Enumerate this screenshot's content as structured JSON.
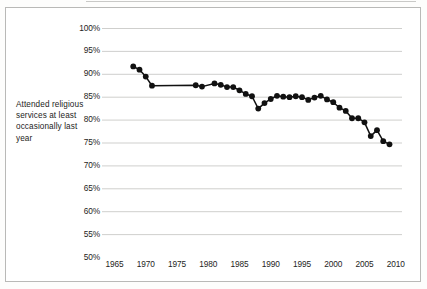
{
  "figure": {
    "axis_caption": "Attended religious services at least occasionally last year"
  },
  "chart_data": {
    "type": "line",
    "title": "",
    "subtitle": "",
    "xlabel": "",
    "ylabel": "Attended religious services at least occasionally last year",
    "xlim": [
      1963,
      2011
    ],
    "ylim": [
      50,
      100
    ],
    "xticks": [
      1965,
      1970,
      1975,
      1980,
      1985,
      1990,
      1995,
      2000,
      2005,
      2010
    ],
    "xtick_labels": [
      "1965",
      "1970",
      "1975",
      "1980",
      "1985",
      "1990",
      "1995",
      "2000",
      "2005",
      "2010"
    ],
    "yticks": [
      50,
      55,
      60,
      65,
      70,
      75,
      80,
      85,
      90,
      95,
      100
    ],
    "ytick_labels": [
      "50%",
      "55%",
      "60%",
      "65%",
      "70%",
      "75%",
      "80%",
      "85%",
      "90%",
      "95%",
      "100%"
    ],
    "grid": "horizontal",
    "legend": "none",
    "marker": "filled-circle",
    "line_color": "#111111",
    "marker_color": "#111111",
    "grid_color": "#c9c9c7",
    "x": [
      1968,
      1969,
      1970,
      1971,
      1978,
      1979,
      1981,
      1982,
      1983,
      1984,
      1985,
      1986,
      1987,
      1988,
      1989,
      1990,
      1991,
      1992,
      1993,
      1994,
      1995,
      1996,
      1997,
      1998,
      1999,
      2000,
      2001,
      2002,
      2003,
      2004,
      2005,
      2006,
      2007,
      2008,
      2009
    ],
    "y": [
      91.6,
      90.9,
      89.4,
      87.4,
      87.5,
      87.2,
      87.9,
      87.6,
      87.1,
      87.1,
      86.4,
      85.6,
      85.1,
      82.4,
      83.6,
      84.5,
      85.2,
      85.0,
      84.9,
      85.1,
      84.9,
      84.3,
      84.8,
      85.2,
      84.4,
      83.8,
      82.6,
      81.9,
      80.3,
      80.3,
      79.4,
      76.4,
      77.7,
      75.3,
      74.6
    ],
    "series_name": "Attended religious services at least occasionally last year"
  }
}
